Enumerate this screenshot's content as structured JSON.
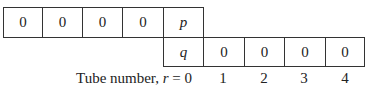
{
  "top_row": [
    "0",
    "0",
    "0",
    "0"
  ],
  "top_variable": "p",
  "bottom_variable": "q",
  "bottom_row": [
    "0",
    "0",
    "0",
    "0"
  ],
  "axis": {
    "label_prefix": "Tube number, ",
    "label_var": "r",
    "label_suffix": " = 0",
    "tube_numbers": [
      "1",
      "2",
      "3",
      "4"
    ]
  }
}
